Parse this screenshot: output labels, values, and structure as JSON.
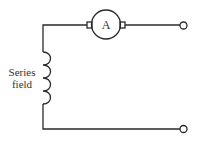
{
  "diagram": {
    "armature": {
      "label": "A"
    },
    "field": {
      "label_line1": "Series",
      "label_line2": "field"
    },
    "colors": {
      "stroke": "#2a2a2a",
      "text": "#333333",
      "background": "#ffffff"
    }
  }
}
